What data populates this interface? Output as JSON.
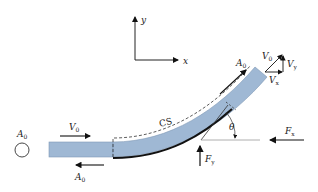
{
  "diagram": {
    "axes": {
      "x_label": "x",
      "y_label": "y"
    },
    "labels": {
      "inlet_area": "A",
      "inlet_area_sub": "0",
      "inlet_velocity": "V",
      "inlet_velocity_sub": "0",
      "inlet_area_force": "A",
      "inlet_area_force_sub": "0",
      "outlet_area": "A",
      "outlet_area_sub": "0",
      "control_surface": "CS",
      "angle": "θ",
      "force_x": "F",
      "force_x_sub": "x",
      "force_y": "F",
      "force_y_sub": "y",
      "velocity_triangle_v0": "V",
      "velocity_triangle_v0_sub": "0",
      "velocity_triangle_vx": "V",
      "velocity_triangle_vx_sub": "x",
      "velocity_triangle_vy": "V",
      "velocity_triangle_vy_sub": "y"
    },
    "colors": {
      "jet_fill": "#9fb8d4",
      "jet_stroke": "#6f8aa8",
      "vane": "#111111",
      "arrow": "#111111",
      "guide_line": "#888888"
    }
  }
}
